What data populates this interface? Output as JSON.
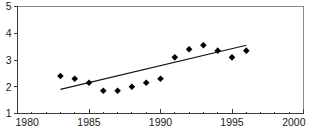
{
  "chart_data": {
    "type": "scatter",
    "title": "",
    "subtitle": "",
    "xlabel": "",
    "ylabel": "",
    "xlim": [
      1980,
      2000
    ],
    "ylim": [
      1,
      5
    ],
    "grid": false,
    "legend": false,
    "legend_position": "none",
    "x_ticks": [
      1980,
      1985,
      1990,
      1995,
      2000
    ],
    "x_tick_labels": [
      "1980",
      "1985",
      "1990",
      "1995",
      "2000"
    ],
    "x_minor_ticks": [
      1981,
      1982,
      1983,
      1984,
      1986,
      1987,
      1988,
      1989,
      1991,
      1992,
      1993,
      1994,
      1996,
      1997,
      1998,
      1999
    ],
    "y_ticks": [
      1,
      2,
      3,
      4,
      5
    ],
    "y_tick_labels": [
      "1",
      "2",
      "3",
      "4",
      "5"
    ],
    "marker": "diamond",
    "marker_color": "#000000",
    "trendline_color": "#111111",
    "x": [
      1983,
      1984,
      1985,
      1986,
      1987,
      1988,
      1989,
      1990,
      1991,
      1992,
      1993,
      1994,
      1995,
      1996
    ],
    "values": [
      2.4,
      2.3,
      2.15,
      1.85,
      1.85,
      2.0,
      2.15,
      2.3,
      3.1,
      3.4,
      3.55,
      3.35,
      3.1,
      3.35
    ],
    "series": [
      {
        "name": "observations",
        "type": "scatter",
        "x": [
          1983,
          1984,
          1985,
          1986,
          1987,
          1988,
          1989,
          1990,
          1991,
          1992,
          1993,
          1994,
          1995,
          1996
        ],
        "values": [
          2.4,
          2.3,
          2.15,
          1.85,
          1.85,
          2.0,
          2.15,
          2.3,
          3.1,
          3.4,
          3.55,
          3.35,
          3.1,
          3.35
        ]
      },
      {
        "name": "trend-line",
        "type": "line",
        "x": [
          1983,
          1996
        ],
        "values": [
          1.9,
          3.55
        ]
      }
    ],
    "annotations": []
  }
}
